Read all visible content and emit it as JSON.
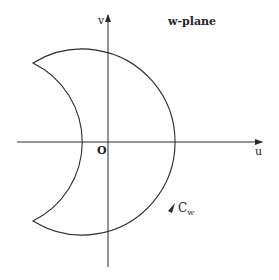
{
  "diagram": {
    "title": "w-plane",
    "axes": {
      "horizontal_label": "u",
      "vertical_label": "v",
      "origin_label": "O"
    },
    "contour": {
      "label": "C",
      "label_subscript": "w",
      "direction": "counterclockwise"
    },
    "colors": {
      "stroke": "#2a2a2a",
      "background": "#ffffff"
    }
  }
}
